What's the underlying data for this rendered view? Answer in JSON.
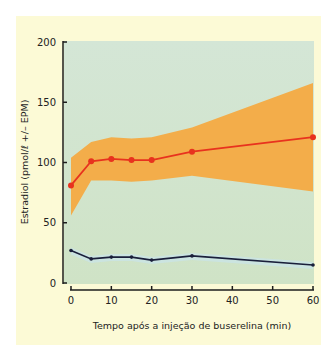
{
  "chart_data": {
    "type": "line",
    "title": "",
    "xlabel": "Tempo após a injeção de buserelina (min)",
    "ylabel": "Estradiol (pmol/ℓ +/– EPM)",
    "xlim": [
      0,
      60
    ],
    "ylim": [
      0,
      200
    ],
    "x_ticks": [
      0,
      10,
      20,
      30,
      40,
      50,
      60
    ],
    "y_ticks": [
      0,
      50,
      100,
      150,
      200
    ],
    "grid": false,
    "legend": "none",
    "series": [
      {
        "name": "Estradiol (treated)",
        "color": "#e8321e",
        "x": [
          0,
          5,
          10,
          15,
          20,
          30,
          60
        ],
        "values": [
          81,
          101,
          103,
          102,
          102,
          109,
          121
        ],
        "band_upper": [
          104,
          117,
          121,
          120,
          121,
          129,
          166
        ],
        "band_lower": [
          56,
          85,
          85,
          84,
          85,
          89,
          76
        ],
        "band_color": "#f3ad4a"
      },
      {
        "name": "Estradiol (control)",
        "color": "#1a1f3a",
        "x": [
          0,
          5,
          10,
          15,
          20,
          30,
          60
        ],
        "values": [
          27,
          20,
          21.5,
          21.5,
          19,
          22.5,
          15
        ],
        "band_color": "#c9e4e6"
      }
    ]
  },
  "labels": {
    "xlabel": "Tempo após a injeção de buserelina (min)",
    "ylabel": "Estradiol (pmol/ℓ +/– EPM)"
  },
  "colors": {
    "panel_bg": "#fcfad6",
    "plot_bg": "#cfe5d2",
    "band": "#f3ad4a",
    "red_line": "#e8321e",
    "dark_line": "#1a1f3a"
  }
}
